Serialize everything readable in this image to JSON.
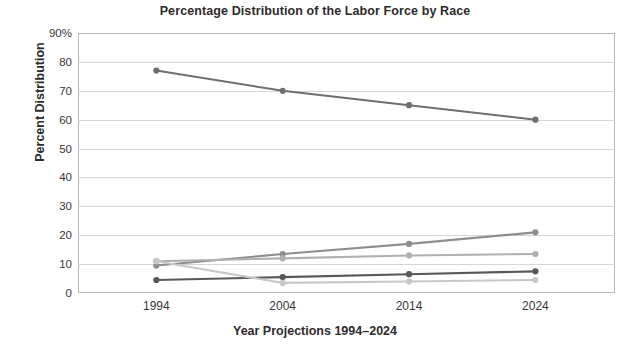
{
  "chart_data": {
    "type": "line",
    "title": "Percentage Distribution of the Labor Force by Race",
    "xlabel": "Year Projections 1994–2024",
    "ylabel": "Percent Distribution",
    "categories": [
      "1994",
      "2004",
      "2014",
      "2024"
    ],
    "x": [
      1994,
      2004,
      2014,
      2024
    ],
    "ylim": [
      0,
      90
    ],
    "yticks": [
      0,
      10,
      20,
      30,
      40,
      50,
      60,
      70,
      80,
      90
    ],
    "ytick_labels": [
      "0",
      "10",
      "20",
      "30",
      "40",
      "50",
      "60",
      "70",
      "80",
      "90%"
    ],
    "grid": true,
    "legend": "none",
    "series": [
      {
        "name": "series-1-declining-top",
        "color": "#6f6e70",
        "values": [
          77,
          70,
          65,
          60
        ]
      },
      {
        "name": "series-2-rising",
        "color": "#8e8d90",
        "values": [
          9.5,
          13.5,
          17,
          21
        ]
      },
      {
        "name": "series-3-light-gray",
        "color": "#b0afb1",
        "values": [
          11,
          12,
          13,
          13.5
        ]
      },
      {
        "name": "series-4-dark-lower",
        "color": "#58575a",
        "values": [
          4.5,
          5.5,
          6.5,
          7.5
        ]
      },
      {
        "name": "series-5-lightest-bottom",
        "color": "#c8c7c9",
        "values": [
          11,
          3.5,
          4,
          4.5
        ]
      }
    ]
  },
  "axis": {
    "y_title": "Percent Distribution",
    "x_title": "Year Projections 1994–2024",
    "y_labels": [
      "90%",
      "80",
      "70",
      "60",
      "50",
      "40",
      "30",
      "20",
      "10",
      "0"
    ],
    "x_labels": [
      "1994",
      "2004",
      "2014",
      "2024"
    ]
  },
  "title": "Percentage Distribution of the Labor Force by Race",
  "colors": {
    "frame": "#b9b7b8",
    "grid": "#d7d5d6",
    "text": "#2f2b2c",
    "background": "#ffffff"
  }
}
